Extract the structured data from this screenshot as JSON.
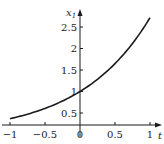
{
  "chart_data": {
    "type": "line",
    "title": "",
    "xlabel": "t",
    "ylabel": "x1",
    "ylabel_main": "x",
    "ylabel_sub": "1",
    "xlim": [
      -1,
      1
    ],
    "ylim": [
      0.3,
      2.75
    ],
    "grid": false,
    "legend": null,
    "x_ticks": [
      -1,
      -0.5,
      0,
      0.5,
      1
    ],
    "x_tick_labels": [
      "−1",
      "−0.5",
      "0",
      "0.5",
      "1"
    ],
    "y_ticks": [
      0.5,
      1,
      1.5,
      2,
      2.5
    ],
    "y_tick_labels": [
      "0.5",
      "1",
      "1.5",
      "2",
      "2.5"
    ],
    "series": [
      {
        "name": "x1 = e^t",
        "color": "#1a1a1a",
        "x": [
          -1,
          -0.75,
          -0.5,
          -0.25,
          0,
          0.25,
          0.5,
          0.75,
          1
        ],
        "values": [
          0.368,
          0.472,
          0.607,
          0.779,
          1.0,
          1.284,
          1.649,
          2.117,
          2.718
        ]
      }
    ]
  },
  "colors": {
    "axis": "#1a1a1a",
    "curve": "#1a1a1a",
    "background": "#ffffff"
  }
}
